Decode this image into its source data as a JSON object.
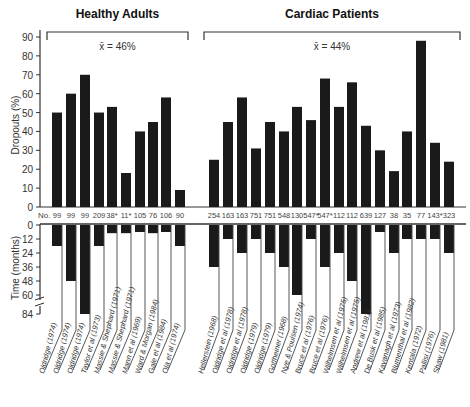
{
  "chart_data": {
    "type": "bar",
    "groups": [
      {
        "title": "Healthy Adults",
        "mean_label": "x̄ = 46%",
        "studies": [
          {
            "citation": "Oldridge (1974)",
            "n": "99",
            "dropout_pct": 50,
            "time_months": 18
          },
          {
            "citation": "Oldridge (1974)",
            "n": "99",
            "dropout_pct": 60,
            "time_months": 48
          },
          {
            "citation": "Oldridge (1974)",
            "n": "99",
            "dropout_pct": 70,
            "time_months": 84
          },
          {
            "citation": "Taylor et al (1973)",
            "n": "209",
            "dropout_pct": 50,
            "time_months": 18
          },
          {
            "citation": "Massie & Shephard (1971)",
            "n": "38*",
            "dropout_pct": 53,
            "time_months": 7
          },
          {
            "citation": "Massie & Shephard (1971)",
            "n": "11*",
            "dropout_pct": 18,
            "time_months": 7
          },
          {
            "citation": "Mann et al (1969)",
            "n": "105",
            "dropout_pct": 40,
            "time_months": 6
          },
          {
            "citation": "Ward & Morgan (1984)",
            "n": "76",
            "dropout_pct": 45,
            "time_months": 7
          },
          {
            "citation": "Gale et al (1984)",
            "n": "106",
            "dropout_pct": 58,
            "time_months": 6
          },
          {
            "citation": "Ola et al (1974)",
            "n": "90",
            "dropout_pct": 9,
            "time_months": 18
          }
        ]
      },
      {
        "title": "Cardiac Patients",
        "mean_label": "x̄ = 44%",
        "studies": [
          {
            "citation": "Hellerstein (1968)",
            "n": "254",
            "dropout_pct": 25,
            "time_months": 36
          },
          {
            "citation": "Oldridge et al (1978)",
            "n": "163",
            "dropout_pct": 45,
            "time_months": 12
          },
          {
            "citation": "Oldridge et al (1978)",
            "n": "163",
            "dropout_pct": 58,
            "time_months": 24
          },
          {
            "citation": "Oldridge (1979)",
            "n": "751",
            "dropout_pct": 31,
            "time_months": 12
          },
          {
            "citation": "Oldridge (1979)",
            "n": "751",
            "dropout_pct": 45,
            "time_months": 24
          },
          {
            "citation": "Gottheiner (1968)",
            "n": "548",
            "dropout_pct": 40,
            "time_months": 36
          },
          {
            "citation": "Nye & Poulsen (1974)",
            "n": "130",
            "dropout_pct": 53,
            "time_months": 60
          },
          {
            "citation": "Bruce et al (1976)",
            "n": "547*",
            "dropout_pct": 46,
            "time_months": 12
          },
          {
            "citation": "Bruce et al (1976)",
            "n": "547*",
            "dropout_pct": 68,
            "time_months": 36
          },
          {
            "citation": "Wilhelmsen et al (1975)",
            "n": "112",
            "dropout_pct": 53,
            "time_months": 24
          },
          {
            "citation": "Wilhelmsen et al (1975)",
            "n": "112",
            "dropout_pct": 66,
            "time_months": 48
          },
          {
            "citation": "Andrew et al (1981)",
            "n": "639",
            "dropout_pct": 43,
            "time_months": 84
          },
          {
            "citation": "De Busk et al (1985)",
            "n": "127",
            "dropout_pct": 30,
            "time_months": 6
          },
          {
            "citation": "Kavanagh et al (1973)",
            "n": "38",
            "dropout_pct": 19,
            "time_months": 24
          },
          {
            "citation": "Blumenthal et al (1982)",
            "n": "35",
            "dropout_pct": 40,
            "time_months": 12
          },
          {
            "citation": "Kentala (1972)",
            "n": "77",
            "dropout_pct": 88,
            "time_months": 12
          },
          {
            "citation": "Pallisi (1976)",
            "n": "143*",
            "dropout_pct": 34,
            "time_months": 12
          },
          {
            "citation": "Shaw (1981)",
            "n": "323",
            "dropout_pct": 24,
            "time_months": 24
          }
        ]
      }
    ],
    "top_panel": {
      "ylabel": "Dropouts (%)",
      "yticks": [
        0,
        10,
        20,
        30,
        40,
        50,
        60,
        70,
        80,
        90
      ],
      "ylim": [
        0,
        90
      ]
    },
    "bottom_panel": {
      "ylabel": "Time (months)",
      "yticks": [
        "0",
        "12",
        "24",
        "36",
        "48",
        "60",
        "84"
      ],
      "axis_break_between": [
        60,
        84
      ]
    },
    "n_row_label": "No.",
    "grid": false,
    "legend": null
  }
}
